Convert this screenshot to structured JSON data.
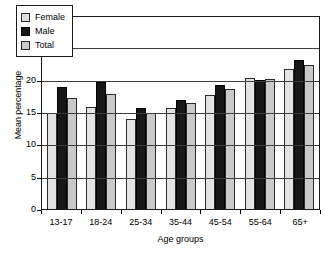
{
  "chart_data": {
    "type": "bar",
    "title": "",
    "xlabel": "Age groups",
    "ylabel": "Mean percentage",
    "categories": [
      "13-17",
      "18-24",
      "25-34",
      "35-44",
      "45-54",
      "55-64",
      "65+"
    ],
    "series": [
      {
        "name": "Female",
        "color": "#e3e3e3",
        "values": [
          15.0,
          16.0,
          14.0,
          15.8,
          17.8,
          20.4,
          21.8
        ]
      },
      {
        "name": "Male",
        "color": "#171717",
        "values": [
          19.0,
          19.8,
          15.8,
          17.1,
          19.4,
          20.1,
          23.3
        ]
      },
      {
        "name": "Total",
        "color": "#c9c9c9",
        "values": [
          17.3,
          18.0,
          15.0,
          16.5,
          18.8,
          20.3,
          22.5
        ]
      }
    ],
    "ylim": [
      0,
      30
    ],
    "yticks": [
      0,
      5,
      10,
      15,
      20,
      25,
      30
    ],
    "ytick_labels": [
      "0",
      "5",
      "10",
      "15",
      "20",
      "25",
      "30"
    ],
    "grid": true,
    "grid_axis": "y",
    "legend_position": "top-left",
    "legend_entries": [
      "Female",
      "Male",
      "Total"
    ]
  }
}
